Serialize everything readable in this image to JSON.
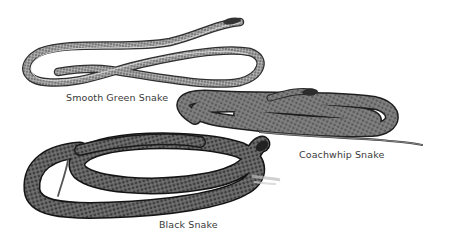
{
  "illustration": {
    "background": "#ffffff",
    "ink_color": "#2b2b2b",
    "snakes": [
      {
        "id": "smooth-green",
        "label": "Smooth Green Snake"
      },
      {
        "id": "coachwhip",
        "label": "Coachwhip Snake"
      },
      {
        "id": "black",
        "label": "Black Snake"
      }
    ]
  }
}
